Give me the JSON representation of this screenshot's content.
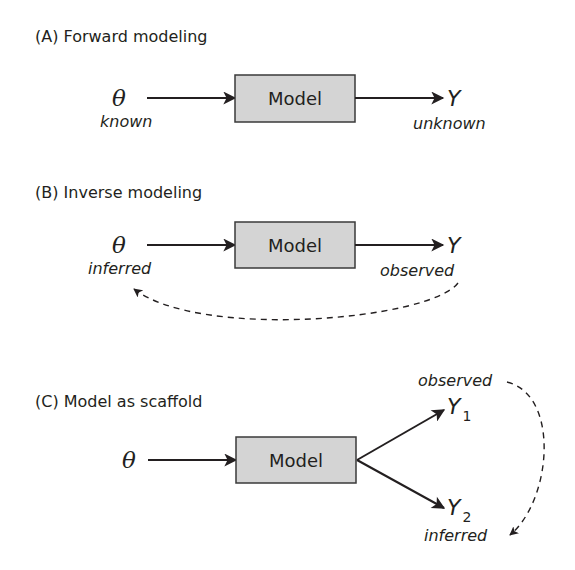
{
  "panels": {
    "A": {
      "title": "(A) Forward modeling",
      "input_symbol": "θ",
      "input_label": "known",
      "box_label": "Model",
      "output_symbol": "Y",
      "output_label": "unknown"
    },
    "B": {
      "title": "(B) Inverse modeling",
      "input_symbol": "θ",
      "input_label": "inferred",
      "box_label": "Model",
      "output_symbol": "Y",
      "output_label": "observed",
      "feedback": "dashed arrow from observed Y back to inferred θ"
    },
    "C": {
      "title": "(C) Model as scaffold",
      "input_symbol": "θ",
      "box_label": "Model",
      "output1_symbol": "Y",
      "output1_subscript": "1",
      "output1_label": "observed",
      "output2_symbol": "Y",
      "output2_subscript": "2",
      "output2_label": "inferred",
      "feedback": "dashed arrow from observed Y1 to inferred Y2"
    }
  },
  "colors": {
    "box_fill": "#d4d4d4",
    "stroke": "#231f20"
  }
}
